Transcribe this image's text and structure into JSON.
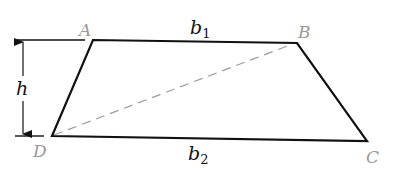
{
  "diagram": {
    "type": "trapezoid",
    "vertices": {
      "A": {
        "label": "A",
        "x": 93,
        "y": 40
      },
      "B": {
        "label": "B",
        "x": 297,
        "y": 43
      },
      "C": {
        "label": "C",
        "x": 367,
        "y": 141
      },
      "D": {
        "label": "D",
        "x": 52,
        "y": 136
      }
    },
    "labels": {
      "A": "A",
      "B": "B",
      "C": "C",
      "D": "D",
      "b1_base": "b",
      "b1_sub": "1",
      "b2_base": "b",
      "b2_sub": "2",
      "h": "h"
    },
    "diagonal": {
      "from": "D",
      "to": "B",
      "style": "dashed"
    },
    "colors": {
      "stroke": "#111111",
      "diagonal": "#9a9a9a",
      "vertex_label": "#9a9a9a",
      "measure_label": "#111111",
      "background": "#ffffff"
    }
  }
}
